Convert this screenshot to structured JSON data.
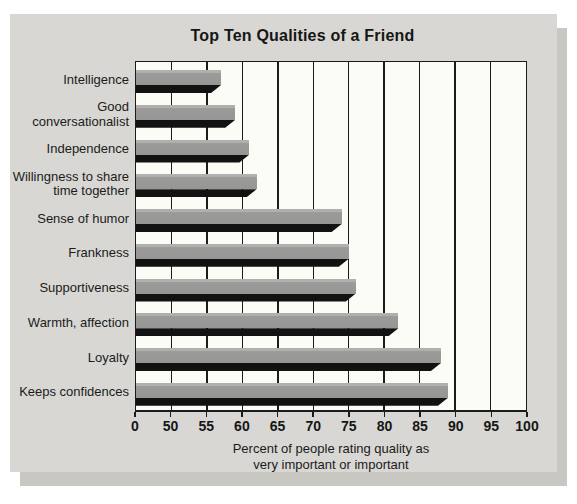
{
  "panel": {
    "background_color": "#d8d7d3",
    "shadow_color": "#c8c7c2"
  },
  "chart_data": {
    "type": "bar",
    "orientation": "horizontal",
    "title": "Top Ten Qualities of a Friend",
    "categories": [
      "Intelligence",
      "Good conversationalist",
      "Independence",
      "Willingness to share time together",
      "Sense of humor",
      "Frankness",
      "Supportiveness",
      "Warmth, affection",
      "Loyalty",
      "Keeps confidences"
    ],
    "category_display_lines": [
      [
        "Intelligence"
      ],
      [
        "Good",
        "conversationalist"
      ],
      [
        "Independence"
      ],
      [
        "Willingness to share",
        "time together"
      ],
      [
        "Sense of humor"
      ],
      [
        "Frankness"
      ],
      [
        "Supportiveness"
      ],
      [
        "Warmth, affection"
      ],
      [
        "Loyalty"
      ],
      [
        "Keeps confidences"
      ]
    ],
    "values": [
      57,
      59,
      61,
      62,
      74,
      75,
      76,
      82,
      88,
      89
    ],
    "xlabel": "Percent of people rating quality as very important or important",
    "xlabel_lines": [
      "Percent of people rating quality as",
      "very important or important"
    ],
    "ylabel": "",
    "x_ticks": [
      "0",
      "50",
      "55",
      "60",
      "65",
      "70",
      "75",
      "80",
      "85",
      "90",
      "95",
      "100"
    ],
    "xlim": [
      0,
      100
    ],
    "x_axis_break": "axis is compressed between 0 and 50; one gridline interval per 5 units thereafter",
    "grid": "vertical gridlines at every tick",
    "legend": "none",
    "colors": {
      "bar_fill": "#9b9b99",
      "bar_3d_shadow": "#121212",
      "plot_background": "#fcfcf6",
      "gridline": "#1b1b1b",
      "text": "#1b1b1b"
    }
  }
}
